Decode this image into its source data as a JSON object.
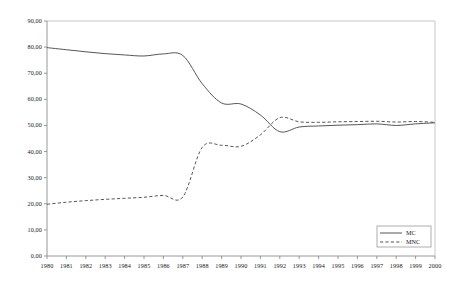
{
  "chart_data": {
    "type": "line",
    "title": "",
    "subtitle": "",
    "xlabel": "",
    "ylabel": "",
    "grid": false,
    "legend_position": "bottom-right",
    "xlim": [
      1980,
      2000
    ],
    "ylim": [
      0,
      90
    ],
    "ytick_step": 10,
    "categories": [
      "1980",
      "1981",
      "1982",
      "1983",
      "1984",
      "1985",
      "1986",
      "1987",
      "1988",
      "1989",
      "1990",
      "1991",
      "1992",
      "1993",
      "1994",
      "1995",
      "1996",
      "1997",
      "1998",
      "1999",
      "2000"
    ],
    "x": [
      1980,
      1981,
      1982,
      1983,
      1984,
      1985,
      1986,
      1987,
      1988,
      1989,
      1990,
      1991,
      1992,
      1993,
      1994,
      1995,
      1996,
      1997,
      1998,
      1999,
      2000
    ],
    "ytick_labels": [
      "0,00",
      "10,00",
      "20,00",
      "30,00",
      "40,00",
      "50,00",
      "60,00",
      "70,00",
      "80,00",
      "90,00"
    ],
    "ytick_values": [
      0,
      10,
      20,
      30,
      40,
      50,
      60,
      70,
      80,
      90
    ],
    "series": [
      {
        "name": "MC",
        "style": "solid",
        "color": "#4d4d4d",
        "values": [
          79.8,
          79.0,
          78.2,
          77.5,
          77.0,
          76.6,
          77.4,
          76.8,
          66.0,
          58.6,
          58.2,
          54.0,
          47.6,
          49.4,
          49.8,
          50.1,
          50.3,
          50.6,
          50.0,
          50.6,
          51.0
        ]
      },
      {
        "name": "MNC",
        "style": "dashed",
        "color": "#4d4d4d",
        "values": [
          19.8,
          20.6,
          21.2,
          21.7,
          22.1,
          22.5,
          23.2,
          22.6,
          41.6,
          42.4,
          42.0,
          46.4,
          53.0,
          51.4,
          51.2,
          51.4,
          51.5,
          51.6,
          51.3,
          51.5,
          51.2
        ]
      }
    ],
    "legend": [
      {
        "label": "MC",
        "style": "solid"
      },
      {
        "label": "MNC",
        "style": "dashed"
      }
    ]
  },
  "axes": {
    "axis_color": "#8c8c8c",
    "frame_color": "#b5b5b5"
  }
}
